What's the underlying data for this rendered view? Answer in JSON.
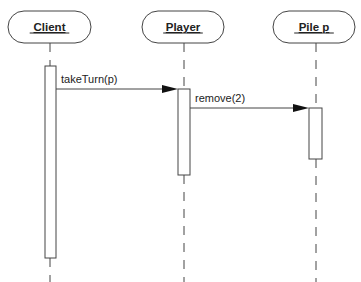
{
  "diagram": {
    "type": "sequence",
    "colors": {
      "stroke": "#444444",
      "text": "#222222",
      "background": "#ffffff"
    },
    "objects": [
      {
        "id": "client",
        "label": "Client",
        "box": {
          "x": 8,
          "y": 11,
          "w": 83,
          "h": 32
        },
        "lifeline_x": 50
      },
      {
        "id": "player",
        "label": "Player",
        "box": {
          "x": 142,
          "y": 11,
          "w": 82,
          "h": 32
        },
        "lifeline_x": 184
      },
      {
        "id": "pile",
        "label": "Pile p",
        "box": {
          "x": 273,
          "y": 11,
          "w": 82,
          "h": 32
        },
        "lifeline_x": 316
      }
    ],
    "activations": [
      {
        "object": "client",
        "x": 45,
        "y": 66,
        "w": 11,
        "h": 192
      },
      {
        "object": "player",
        "x": 178,
        "y": 89,
        "w": 12,
        "h": 86
      },
      {
        "object": "pile",
        "x": 309,
        "y": 108,
        "w": 13,
        "h": 51
      }
    ],
    "messages": [
      {
        "label": "takeTurn(p)",
        "from": "client",
        "to": "player",
        "y": 89,
        "x1": 56,
        "x2": 178
      },
      {
        "label": "remove(2)",
        "from": "player",
        "to": "pile",
        "y": 108,
        "x1": 190,
        "x2": 309
      }
    ]
  }
}
